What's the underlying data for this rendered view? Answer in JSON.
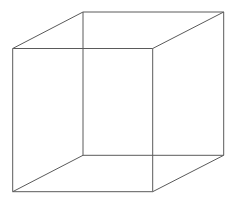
{
  "diagram": {
    "type": "wireframe-cube",
    "canvas": {
      "width": 234,
      "height": 202,
      "background": "#ffffff"
    },
    "stroke_color": "#5a5a5a",
    "stroke_width": 1,
    "vertices": {
      "front_top_left": [
        12.7,
        48.5
      ],
      "front_top_right": [
        152.7,
        48.5
      ],
      "front_bottom_right": [
        152.7,
        191.7
      ],
      "front_bottom_left": [
        12.7,
        191.7
      ],
      "back_top_left": [
        83,
        12
      ],
      "back_top_right": [
        223.7,
        12
      ],
      "back_bottom_right": [
        223.7,
        155.3
      ],
      "back_bottom_left": [
        83,
        155.3
      ]
    },
    "edges": [
      {
        "name": "front-top-edge",
        "from": "front_top_left",
        "to": "front_top_right"
      },
      {
        "name": "front-right-edge",
        "from": "front_top_right",
        "to": "front_bottom_right"
      },
      {
        "name": "front-bottom-edge",
        "from": "front_bottom_right",
        "to": "front_bottom_left"
      },
      {
        "name": "front-left-edge",
        "from": "front_bottom_left",
        "to": "front_top_left"
      },
      {
        "name": "back-top-edge",
        "from": "back_top_left",
        "to": "back_top_right"
      },
      {
        "name": "back-right-edge",
        "from": "back_top_right",
        "to": "back_bottom_right"
      },
      {
        "name": "back-bottom-edge",
        "from": "back_bottom_right",
        "to": "back_bottom_left"
      },
      {
        "name": "back-left-edge",
        "from": "back_bottom_left",
        "to": "back_top_left"
      },
      {
        "name": "connector-top-left",
        "from": "front_top_left",
        "to": "back_top_left"
      },
      {
        "name": "connector-top-right",
        "from": "front_top_right",
        "to": "back_top_right"
      },
      {
        "name": "connector-bottom-right",
        "from": "front_bottom_right",
        "to": "back_bottom_right"
      },
      {
        "name": "connector-bottom-left",
        "from": "front_bottom_left",
        "to": "back_bottom_left"
      }
    ]
  }
}
